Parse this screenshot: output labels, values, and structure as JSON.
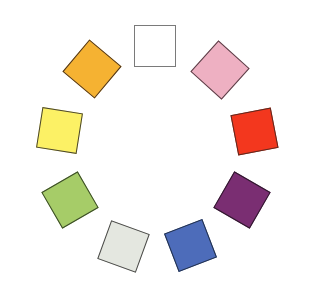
{
  "diagram": {
    "type": "color-wheel",
    "canvas": {
      "width": 312,
      "height": 291,
      "background": "#ffffff"
    },
    "swatches": [
      {
        "name": "white",
        "color": "#ffffff",
        "border": "#7a7a7a",
        "cx": 155,
        "cy": 46,
        "size": 42,
        "rotation": 0
      },
      {
        "name": "pink",
        "color": "#eeb0c2",
        "border": "#5a4048",
        "cx": 220,
        "cy": 70,
        "size": 42,
        "rotation": 42
      },
      {
        "name": "red",
        "color": "#f3371e",
        "border": "#5a2a20",
        "cx": 254,
        "cy": 131,
        "size": 41,
        "rotation": -11
      },
      {
        "name": "purple",
        "color": "#7a2e72",
        "border": "#2e1a2c",
        "cx": 242,
        "cy": 200,
        "size": 42,
        "rotation": 30
      },
      {
        "name": "blue",
        "color": "#4d6cba",
        "border": "#22304a",
        "cx": 190,
        "cy": 245,
        "size": 41,
        "rotation": -21
      },
      {
        "name": "light-gray",
        "color": "#e4e7e0",
        "border": "#4a4a48",
        "cx": 123,
        "cy": 246,
        "size": 41,
        "rotation": 20
      },
      {
        "name": "green",
        "color": "#a6cc68",
        "border": "#3a4a28",
        "cx": 70,
        "cy": 200,
        "size": 42,
        "rotation": -30
      },
      {
        "name": "yellow",
        "color": "#fcf165",
        "border": "#4a4630",
        "cx": 59,
        "cy": 130,
        "size": 41,
        "rotation": 9
      },
      {
        "name": "orange",
        "color": "#f5b232",
        "border": "#4a3420",
        "cx": 92,
        "cy": 69,
        "size": 42,
        "rotation": 40
      }
    ]
  }
}
